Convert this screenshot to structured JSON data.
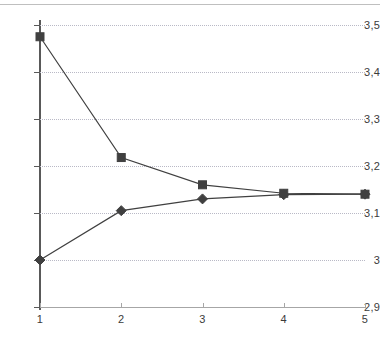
{
  "chart_data": {
    "type": "line",
    "title": "",
    "subtitle": "",
    "xlabel": "",
    "ylabel": "",
    "x": [
      1,
      2,
      3,
      4,
      5
    ],
    "xtick_labels": [
      "1",
      "2",
      "3",
      "4",
      "5"
    ],
    "xlim": [
      1,
      5
    ],
    "ylim": [
      2.9,
      3.5
    ],
    "ytick_values": [
      2.9,
      3.0,
      3.1,
      3.2,
      3.3,
      3.4,
      3.5
    ],
    "ytick_labels": [
      "2,9",
      "3",
      "3,1",
      "3,2",
      "3,3",
      "3,4",
      "3,5"
    ],
    "grid": true,
    "grid_axis": "y",
    "grid_style": "dotted",
    "legend": false,
    "legend_position": "none",
    "series": [
      {
        "name": "upper",
        "marker": "square",
        "color": "#404040",
        "values": [
          3.475,
          3.218,
          3.16,
          3.142,
          3.14
        ]
      },
      {
        "name": "lower",
        "marker": "diamond",
        "color": "#404040",
        "values": [
          3.0,
          3.105,
          3.13,
          3.139,
          3.14
        ]
      }
    ],
    "colors": {
      "axis": "#595959",
      "grid": "#b9b9c6",
      "series": "#404040",
      "text": "#3b3b3b",
      "background": "#ffffff"
    }
  }
}
